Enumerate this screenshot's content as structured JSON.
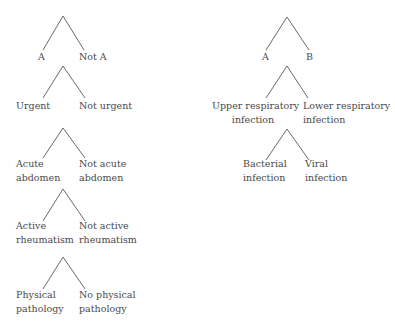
{
  "diagram": {
    "left_column": [
      {
        "left": [
          "A"
        ],
        "right": [
          "Not A"
        ]
      },
      {
        "left": [
          "Urgent"
        ],
        "right": [
          "Not urgent"
        ]
      },
      {
        "left": [
          "Acute",
          "abdomen"
        ],
        "right": [
          "Not acute",
          "abdomen"
        ]
      },
      {
        "left": [
          "Active",
          "rheumatism"
        ],
        "right": [
          "Not active",
          "rheumatism"
        ]
      },
      {
        "left": [
          "Physical",
          "pathology"
        ],
        "right": [
          "No physical",
          "pathology"
        ]
      }
    ],
    "right_column": [
      {
        "left": [
          "A"
        ],
        "right": [
          "B"
        ]
      },
      {
        "left": [
          "Upper respiratory",
          "infection"
        ],
        "right": [
          "Lower respiratory",
          "infection"
        ]
      },
      {
        "left": [
          "Bacterial",
          "infection"
        ],
        "right": [
          "Viral",
          "infection"
        ]
      }
    ],
    "colors": {
      "line": "#6a6a6a",
      "text": "#4a4a4a",
      "background": "#ffffff"
    }
  }
}
